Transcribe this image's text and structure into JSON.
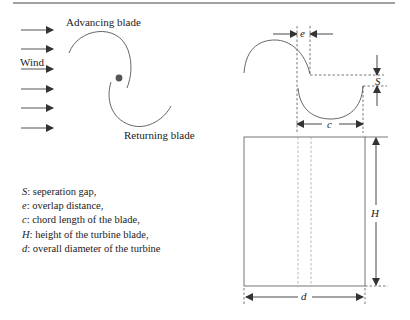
{
  "figure": {
    "left_panel": {
      "wind_label": "Wind",
      "advancing_label": "Advancing blade",
      "returning_label": "Returning blade",
      "wind_arrow_count": 6
    },
    "dimension_labels": {
      "overlap": "e",
      "separation": "S",
      "chord": "c",
      "height": "H",
      "diameter": "d"
    },
    "legend": [
      {
        "symbol": "S",
        "text": ": seperation gap,"
      },
      {
        "symbol": "e",
        "text": ": overlap distance,"
      },
      {
        "symbol": "c",
        "text": ": chord length of the blade,"
      },
      {
        "symbol": "H",
        "text": ": height of the turbine blade,"
      },
      {
        "symbol": "d",
        "text": ": overall diameter of the turbine"
      }
    ],
    "colors": {
      "line": "#555555",
      "dashed": "#555555",
      "rule": "#444444",
      "hub": "#555555"
    }
  }
}
